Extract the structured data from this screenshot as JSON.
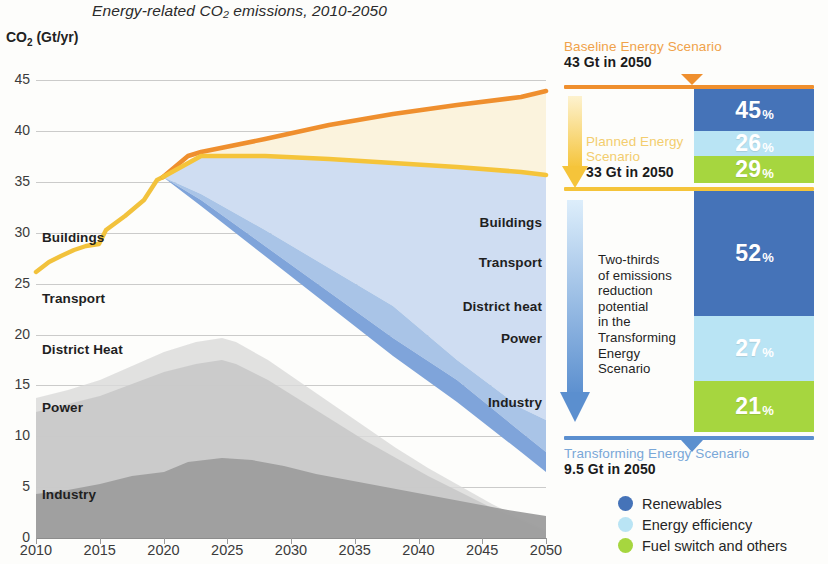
{
  "title": "Energy-related CO₂ emissions, 2010-2050",
  "y_axis_label": "CO₂ (Gt/yr)",
  "colors": {
    "baseline": "#ef8f2e",
    "baseline_fill": "#fbf2dc",
    "planned": "#f5c43a",
    "transforming": "#4573b8",
    "transforming_light": "#a8c4e8",
    "renewables": "#4573b8",
    "efficiency": "#b9e4f4",
    "fuel_switch": "#a6d63f",
    "industry_gray": "#9d9d9d",
    "power_gray": "#c4c4c4",
    "district_gray": "#d4d4d4"
  },
  "plot_labels_left": [
    {
      "text": "Buildings",
      "value": 29.5
    },
    {
      "text": "Transport",
      "value": 23.5
    },
    {
      "text": "District Heat",
      "value": 18.5
    },
    {
      "text": "Power",
      "value": 12.8
    },
    {
      "text": "Industry",
      "value": 4.2
    }
  ],
  "plot_labels_right": [
    {
      "text": "Buildings",
      "value": 31.0
    },
    {
      "text": "Transport",
      "value": 27.0
    },
    {
      "text": "District heat",
      "value": 22.7
    },
    {
      "text": "Power",
      "value": 19.6
    },
    {
      "text": "Industry",
      "value": 13.3
    }
  ],
  "scenarios": {
    "baseline": {
      "name": "Baseline Energy Scenario",
      "value": "43 Gt in 2050"
    },
    "planned": {
      "name": "Planned Energy\nScenario",
      "name_line1": "Planned Energy",
      "name_line2": "Scenario",
      "value": "33 Gt in 2050"
    },
    "transforming": {
      "name": "Transforming Energy Scenario",
      "value": "9.5 Gt in 2050"
    }
  },
  "annotation": "Two-thirds\nof emissions\nreduction\npotential\nin the\nTransforming\nEnergy\nScenario",
  "bars": [
    {
      "id": "planned-gap",
      "segments": [
        {
          "label": "Renewables",
          "value": 45,
          "value_text": "45",
          "pct": "%"
        },
        {
          "label": "Energy efficiency",
          "value": 26,
          "value_text": "26",
          "pct": "%"
        },
        {
          "label": "Fuel switch and others",
          "value": 29,
          "value_text": "29",
          "pct": "%"
        }
      ]
    },
    {
      "id": "transforming-gap",
      "segments": [
        {
          "label": "Renewables",
          "value": 52,
          "value_text": "52",
          "pct": "%"
        },
        {
          "label": "Energy efficiency",
          "value": 27,
          "value_text": "27",
          "pct": "%"
        },
        {
          "label": "Fuel switch and others",
          "value": 21,
          "value_text": "21",
          "pct": "%"
        }
      ]
    }
  ],
  "legend": [
    {
      "label": "Renewables",
      "color": "#4573b8"
    },
    {
      "label": "Energy efficiency",
      "color": "#b9e4f4"
    },
    {
      "label": "Fuel switch and others",
      "color": "#a6d63f"
    }
  ],
  "chart_data": {
    "type": "area",
    "title": "Energy-related CO₂ emissions, 2010-2050",
    "xlabel": "",
    "ylabel": "CO₂ (Gt/yr)",
    "xlim": [
      2010,
      2050
    ],
    "ylim": [
      0,
      47
    ],
    "yticks": [
      0,
      5,
      10,
      15,
      20,
      25,
      30,
      35,
      40,
      45
    ],
    "xticks": [
      2010,
      2015,
      2020,
      2025,
      2030,
      2035,
      2040,
      2045,
      2050
    ],
    "grid": true,
    "legend_position": "bottom-right",
    "x_history": [
      2010,
      2011,
      2012,
      2013,
      2014,
      2015,
      2016,
      2017,
      2018,
      2019,
      2020
    ],
    "series": [
      {
        "name": "Historical total emissions",
        "type": "line",
        "color": "#f5c43a",
        "x": [
          2010,
          2011,
          2012,
          2013,
          2014,
          2015,
          2016,
          2017,
          2018,
          2019,
          2020
        ],
        "values": [
          29.6,
          30.6,
          31.2,
          31.7,
          32.0,
          32.1,
          32.3,
          33.2,
          34.1,
          35.0,
          34.0
        ]
      },
      {
        "name": "Baseline Energy Scenario",
        "type": "line",
        "color": "#ef8f2e",
        "x": [
          2020,
          2022,
          2025,
          2030,
          2035,
          2040,
          2045,
          2050
        ],
        "values": [
          34.0,
          35.6,
          36.7,
          38.4,
          39.9,
          41.2,
          42.2,
          43.0
        ],
        "endpoint_label": "43 Gt in 2050"
      },
      {
        "name": "Planned Energy Scenario",
        "type": "line",
        "color": "#f5c43a",
        "x": [
          2020,
          2025,
          2030,
          2035,
          2040,
          2045,
          2050
        ],
        "values": [
          34.0,
          35.0,
          35.0,
          34.8,
          34.3,
          33.7,
          33.0
        ],
        "endpoint_label": "33 Gt in 2050"
      },
      {
        "name": "Transforming Energy Scenario",
        "type": "line",
        "color": "#4573b8",
        "x": [
          2020,
          2025,
          2030,
          2035,
          2040,
          2045,
          2050
        ],
        "values": [
          34.0,
          30.9,
          27.8,
          24.7,
          21.6,
          15.0,
          9.5
        ],
        "endpoint_label": "9.5 Gt in 2050"
      }
    ],
    "stacked_history_sectors": [
      {
        "name": "Industry",
        "color": "#9d9d9d",
        "peak": 9.2
      },
      {
        "name": "Power",
        "color": "#c4c4c4",
        "peak": 20.8
      },
      {
        "name": "District Heat",
        "color": "#d4d4d4"
      },
      {
        "name": "Transport"
      },
      {
        "name": "Buildings"
      }
    ],
    "reduction_breakdown": [
      {
        "gap": "Baseline to Planned Energy Scenario",
        "segments": [
          {
            "label": "Renewables",
            "value": 45
          },
          {
            "label": "Energy efficiency",
            "value": 26
          },
          {
            "label": "Fuel switch and others",
            "value": 29
          }
        ]
      },
      {
        "gap": "Planned to Transforming Energy Scenario",
        "segments": [
          {
            "label": "Renewables",
            "value": 52
          },
          {
            "label": "Energy efficiency",
            "value": 27
          },
          {
            "label": "Fuel switch and others",
            "value": 21
          }
        ]
      }
    ],
    "annotations": [
      "Two-thirds of emissions reduction potential in the Transforming Energy Scenario"
    ]
  }
}
